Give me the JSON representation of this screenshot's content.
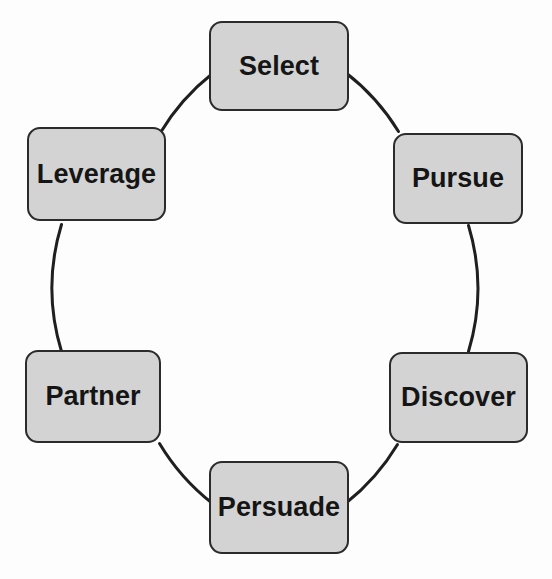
{
  "diagram": {
    "type": "cycle",
    "shape": "circle",
    "node_count": 6,
    "colors": {
      "node_fill": "#d3d3d3",
      "node_border": "#2b2b2b",
      "label_text": "#151515",
      "connector": "#1f1f1f",
      "background": "#fdfdfd"
    },
    "geometry": {
      "center_x": 278,
      "center_y": 288,
      "radius": 218
    },
    "nodes": [
      {
        "id": "select",
        "label": "Select",
        "position": "top",
        "order": 1
      },
      {
        "id": "pursue",
        "label": "Pursue",
        "position": "upper-right",
        "order": 2
      },
      {
        "id": "discover",
        "label": "Discover",
        "position": "lower-right",
        "order": 3
      },
      {
        "id": "persuade",
        "label": "Persuade",
        "position": "bottom",
        "order": 4
      },
      {
        "id": "partner",
        "label": "Partner",
        "position": "lower-left",
        "order": 5
      },
      {
        "id": "leverage",
        "label": "Leverage",
        "position": "upper-left",
        "order": 6
      }
    ],
    "connectors": [
      {
        "from": "select",
        "to": "pursue"
      },
      {
        "from": "pursue",
        "to": "discover"
      },
      {
        "from": "discover",
        "to": "persuade"
      },
      {
        "from": "persuade",
        "to": "partner"
      },
      {
        "from": "partner",
        "to": "leverage"
      },
      {
        "from": "leverage",
        "to": "select"
      }
    ]
  }
}
